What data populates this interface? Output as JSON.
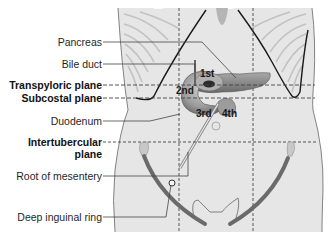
{
  "labels": {
    "pancreas": "Pancreas",
    "bile_duct": "Bile duct",
    "transpyloric_plane": "Transpyloric plane",
    "subcostal_plane": "Subcostal plane",
    "duodenum": "Duodenum",
    "intertubercular_plane_line1": "Intertubercular",
    "intertubercular_plane_line2": "plane",
    "root_of_mesentery": "Root of mesentery",
    "deep_inguinal_ring": "Deep inguinal ring"
  },
  "duodenum_segments": {
    "first": "1st",
    "second": "2nd",
    "third": "3rd",
    "fourth": "4th"
  },
  "colors": {
    "body_fill": "#e4e4e4",
    "body_outline": "#555555",
    "rib_lines": "#c4c4c4",
    "costal_margin": "#1a1a1a",
    "organ_fill": "#8c8c8c",
    "organ_dark": "#5a5a5a",
    "inguinal_ligament": "#6a6a6a",
    "leader_line": "#444444",
    "plane_dash": "#444444"
  }
}
